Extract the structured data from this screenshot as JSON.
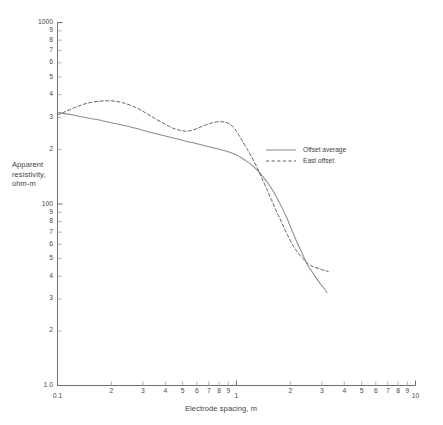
{
  "chart_data": {
    "type": "line",
    "title": "",
    "xlabel": "Electrode spacing, m",
    "ylabel": "Apparent resistivity, ohm-m",
    "xscale": "log",
    "yscale": "log",
    "xlim": [
      0.1,
      10
    ],
    "ylim": [
      10,
      1000
    ],
    "grid": false,
    "legend_position": "center-right",
    "x_major_ticks": [
      {
        "value": 0.1,
        "label": "0.1"
      },
      {
        "value": 1,
        "label": "1"
      },
      {
        "value": 10,
        "label": "10"
      }
    ],
    "x_minor_ticks": [
      {
        "value": 0.2,
        "label": "2"
      },
      {
        "value": 0.3,
        "label": "3"
      },
      {
        "value": 0.4,
        "label": "4"
      },
      {
        "value": 0.5,
        "label": "5"
      },
      {
        "value": 0.6,
        "label": "6"
      },
      {
        "value": 0.7,
        "label": "7"
      },
      {
        "value": 0.8,
        "label": "8"
      },
      {
        "value": 0.9,
        "label": "9"
      },
      {
        "value": 2,
        "label": "2"
      },
      {
        "value": 3,
        "label": "3"
      },
      {
        "value": 4,
        "label": "4"
      },
      {
        "value": 5,
        "label": "5"
      },
      {
        "value": 6,
        "label": "6"
      },
      {
        "value": 7,
        "label": "7"
      },
      {
        "value": 8,
        "label": "8"
      },
      {
        "value": 9,
        "label": "9"
      }
    ],
    "y_major_ticks": [
      {
        "value": 1000,
        "label": "1000"
      },
      {
        "value": 100,
        "label": "100"
      },
      {
        "value": 10,
        "label": "1.0"
      }
    ],
    "y_minor_ticks": [
      {
        "value": 900,
        "label": "9"
      },
      {
        "value": 800,
        "label": "8"
      },
      {
        "value": 700,
        "label": "7"
      },
      {
        "value": 600,
        "label": "6"
      },
      {
        "value": 500,
        "label": "5"
      },
      {
        "value": 400,
        "label": "4"
      },
      {
        "value": 300,
        "label": "3"
      },
      {
        "value": 200,
        "label": "2"
      },
      {
        "value": 90,
        "label": "9"
      },
      {
        "value": 80,
        "label": "8"
      },
      {
        "value": 70,
        "label": "7"
      },
      {
        "value": 60,
        "label": "6"
      },
      {
        "value": 50,
        "label": "5"
      },
      {
        "value": 40,
        "label": "4"
      },
      {
        "value": 30,
        "label": "3"
      },
      {
        "value": 20,
        "label": "2"
      }
    ],
    "series": [
      {
        "name": "Offset average",
        "style": "solid",
        "color": "#8c8c8c",
        "points": [
          [
            0.1,
            320
          ],
          [
            0.12,
            310
          ],
          [
            0.15,
            297
          ],
          [
            0.18,
            287
          ],
          [
            0.22,
            275
          ],
          [
            0.27,
            262
          ],
          [
            0.32,
            250
          ],
          [
            0.38,
            240
          ],
          [
            0.45,
            230
          ],
          [
            0.52,
            222
          ],
          [
            0.6,
            215
          ],
          [
            0.7,
            207
          ],
          [
            0.8,
            200
          ],
          [
            0.9,
            194
          ],
          [
            1.0,
            186
          ],
          [
            1.1,
            176
          ],
          [
            1.2,
            166
          ],
          [
            1.3,
            154
          ],
          [
            1.4,
            142
          ],
          [
            1.5,
            130
          ],
          [
            1.6,
            118
          ],
          [
            1.7,
            106
          ],
          [
            1.8,
            95
          ],
          [
            1.9,
            85
          ],
          [
            2.0,
            75
          ],
          [
            2.1,
            67
          ],
          [
            2.2,
            60
          ],
          [
            2.3,
            55
          ],
          [
            2.4,
            50
          ],
          [
            2.5,
            46
          ],
          [
            2.7,
            41
          ],
          [
            2.9,
            37
          ],
          [
            3.1,
            34
          ],
          [
            3.2,
            32.5
          ]
        ]
      },
      {
        "name": "East offset",
        "style": "dashed",
        "color": "#4d4d4d",
        "points": [
          [
            0.1,
            310
          ],
          [
            0.11,
            322
          ],
          [
            0.125,
            340
          ],
          [
            0.145,
            358
          ],
          [
            0.17,
            368
          ],
          [
            0.2,
            370
          ],
          [
            0.23,
            362
          ],
          [
            0.27,
            342
          ],
          [
            0.31,
            318
          ],
          [
            0.35,
            296
          ],
          [
            0.4,
            275
          ],
          [
            0.44,
            262
          ],
          [
            0.48,
            255
          ],
          [
            0.52,
            252
          ],
          [
            0.56,
            254
          ],
          [
            0.61,
            262
          ],
          [
            0.67,
            272
          ],
          [
            0.73,
            280
          ],
          [
            0.8,
            284
          ],
          [
            0.87,
            282
          ],
          [
            0.93,
            273
          ],
          [
            0.98,
            258
          ],
          [
            1.03,
            240
          ],
          [
            1.08,
            222
          ],
          [
            1.15,
            200
          ],
          [
            1.22,
            180
          ],
          [
            1.3,
            160
          ],
          [
            1.38,
            140
          ],
          [
            1.47,
            122
          ],
          [
            1.57,
            105
          ],
          [
            1.68,
            90
          ],
          [
            1.8,
            78
          ],
          [
            1.92,
            68
          ],
          [
            2.05,
            60
          ],
          [
            2.2,
            54
          ],
          [
            2.35,
            50
          ],
          [
            2.5,
            47
          ],
          [
            2.7,
            45
          ],
          [
            2.9,
            44
          ],
          [
            3.1,
            43
          ],
          [
            3.25,
            42.5
          ]
        ]
      }
    ]
  },
  "legend": {
    "items": [
      {
        "label": "Offset average"
      },
      {
        "label": "East offset"
      }
    ]
  }
}
